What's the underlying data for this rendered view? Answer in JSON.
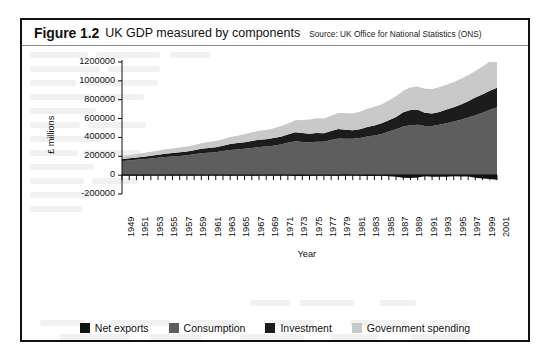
{
  "figure": {
    "number": "Figure 1.2",
    "title": "UK GDP measured by components",
    "source": "Source: UK Office for National Statistics (ONS)"
  },
  "legend": {
    "items": [
      {
        "label": "Net exports",
        "color": "#111111"
      },
      {
        "label": "Consumption",
        "color": "#5e5e5e"
      },
      {
        "label": "Investment",
        "color": "#1c1c1c"
      },
      {
        "label": "Government spending",
        "color": "#c9c9c9"
      }
    ]
  },
  "chart_data": {
    "type": "area",
    "stacked": true,
    "title": "UK GDP measured by components",
    "subtitle": "Source: UK Office for National Statistics (ONS)",
    "xlabel": "Year",
    "ylabel": "£ millions",
    "ylim": [
      -200000,
      1200000
    ],
    "ytick_step": 200000,
    "yticks": [
      -200000,
      0,
      200000,
      400000,
      600000,
      800000,
      1000000,
      1200000
    ],
    "ytick_labels": [
      "-200000",
      "0",
      "200000",
      "400000",
      "600000",
      "800000",
      "1000000",
      "1200000"
    ],
    "xlim": [
      1949,
      2001
    ],
    "xtick_step": 2,
    "grid": false,
    "legend_position": "bottom",
    "x": [
      1949,
      1950,
      1951,
      1952,
      1953,
      1954,
      1955,
      1956,
      1957,
      1958,
      1959,
      1960,
      1961,
      1962,
      1963,
      1964,
      1965,
      1966,
      1967,
      1968,
      1969,
      1970,
      1971,
      1972,
      1973,
      1974,
      1975,
      1976,
      1977,
      1978,
      1979,
      1980,
      1981,
      1982,
      1983,
      1984,
      1985,
      1986,
      1987,
      1988,
      1989,
      1990,
      1991,
      1992,
      1993,
      1994,
      1995,
      1996,
      1997,
      1998,
      1999,
      2000,
      2001
    ],
    "xtick_labels": [
      "1949",
      "1951",
      "1953",
      "1955",
      "1957",
      "1959",
      "1961",
      "1963",
      "1965",
      "1967",
      "1969",
      "1971",
      "1973",
      "1975",
      "1977",
      "1979",
      "1981",
      "1983",
      "1985",
      "1987",
      "1989",
      "1991",
      "1993",
      "1995",
      "1997",
      "1999",
      "2001"
    ],
    "series": [
      {
        "name": "Net exports",
        "color": "#111111",
        "values": [
          2000,
          3000,
          -2000,
          2000,
          1000,
          1000,
          -1000,
          2000,
          2000,
          3000,
          2000,
          -1000,
          1000,
          2000,
          1000,
          -2000,
          1000,
          1000,
          -2000,
          -1000,
          1000,
          1000,
          2000,
          -1000,
          -4000,
          -6000,
          -3000,
          -2000,
          0,
          -2000,
          -3000,
          3000,
          4000,
          -2000,
          -4000,
          -6000,
          -3000,
          -9000,
          -13000,
          -24000,
          -26000,
          -20000,
          -9000,
          -14000,
          -14000,
          -12000,
          -9000,
          -10000,
          -10000,
          -24000,
          -32000,
          -37000,
          -44000
        ]
      },
      {
        "name": "Consumption",
        "color": "#5e5e5e",
        "values": [
          150000,
          155000,
          162000,
          168000,
          176000,
          184000,
          193000,
          198000,
          204000,
          211000,
          221000,
          231000,
          237000,
          244000,
          256000,
          266000,
          273000,
          280000,
          288000,
          298000,
          303000,
          311000,
          324000,
          343000,
          359000,
          352000,
          350000,
          355000,
          353000,
          372000,
          389000,
          387000,
          386000,
          393000,
          411000,
          421000,
          437000,
          462000,
          486000,
          515000,
          530000,
          534000,
          521000,
          521000,
          535000,
          551000,
          568000,
          588000,
          611000,
          634000,
          662000,
          693000,
          718000
        ]
      },
      {
        "name": "Investment",
        "color": "#1c1c1c",
        "values": [
          22000,
          24000,
          25000,
          26000,
          29000,
          32000,
          35000,
          36000,
          38000,
          39000,
          43000,
          48000,
          52000,
          52000,
          55000,
          64000,
          67000,
          69000,
          74000,
          78000,
          79000,
          82000,
          84000,
          87000,
          96000,
          94000,
          90000,
          93000,
          92000,
          96000,
          100000,
          95000,
          89000,
          94000,
          99000,
          106000,
          113000,
          119000,
          131000,
          151000,
          162000,
          159000,
          141000,
          134000,
          136000,
          145000,
          152000,
          161000,
          172000,
          189000,
          196000,
          203000,
          209000
        ]
      },
      {
        "name": "Government spending",
        "color": "#c9c9c9",
        "values": [
          32000,
          34000,
          37000,
          41000,
          43000,
          44000,
          46000,
          49000,
          51000,
          53000,
          56000,
          59000,
          63000,
          67000,
          70000,
          74000,
          79000,
          84000,
          92000,
          95000,
          98000,
          104000,
          110000,
          118000,
          128000,
          140000,
          150000,
          155000,
          157000,
          163000,
          170000,
          176000,
          180000,
          186000,
          193000,
          198000,
          203000,
          211000,
          219000,
          228000,
          238000,
          248000,
          254000,
          258000,
          261000,
          264000,
          268000,
          274000,
          276000,
          282000,
          294000,
          310000,
          325000
        ]
      }
    ]
  }
}
